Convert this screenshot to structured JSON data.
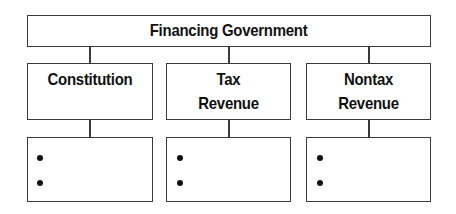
{
  "diagram": {
    "root": {
      "label": "Financing Government"
    },
    "children": [
      {
        "label_lines": [
          "Constitution"
        ],
        "detail_bullets": [
          "",
          ""
        ]
      },
      {
        "label_lines": [
          "Tax",
          "Revenue"
        ],
        "detail_bullets": [
          "",
          ""
        ]
      },
      {
        "label_lines": [
          "Nontax",
          "Revenue"
        ],
        "detail_bullets": [
          "",
          ""
        ]
      }
    ]
  },
  "colors": {
    "border": "#3a3a3a",
    "text": "#111111",
    "background": "#ffffff"
  }
}
